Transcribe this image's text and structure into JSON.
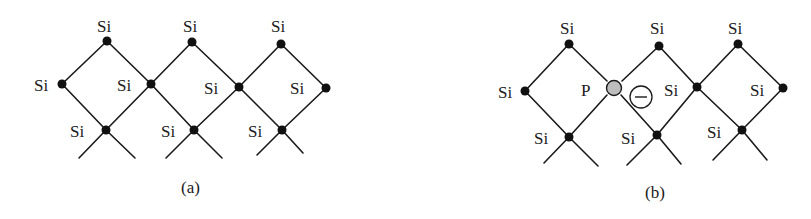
{
  "figure": {
    "panels": [
      {
        "id": "a",
        "caption": "(a)",
        "description": "Pure silicon lattice",
        "atoms": [
          {
            "label": "Si",
            "x": 107,
            "y": 41
          },
          {
            "label": "Si",
            "x": 192,
            "y": 42
          },
          {
            "label": "Si",
            "x": 281,
            "y": 44
          },
          {
            "label": "Si",
            "x": 62,
            "y": 84
          },
          {
            "label": "Si",
            "x": 151,
            "y": 84
          },
          {
            "label": "Si",
            "x": 239,
            "y": 87
          },
          {
            "label": "Si",
            "x": 326,
            "y": 88
          },
          {
            "label": "Si",
            "x": 106,
            "y": 130
          },
          {
            "label": "Si",
            "x": 194,
            "y": 130
          },
          {
            "label": "Si",
            "x": 282,
            "y": 130
          }
        ]
      },
      {
        "id": "b",
        "caption": "(b)",
        "description": "Silicon lattice doped with phosphorus donor and free electron",
        "atoms": [
          {
            "label": "Si",
            "x": 569,
            "y": 44
          },
          {
            "label": "Si",
            "x": 659,
            "y": 46
          },
          {
            "label": "Si",
            "x": 738,
            "y": 44
          },
          {
            "label": "Si",
            "x": 525,
            "y": 91
          },
          {
            "label": "P",
            "x": 614,
            "y": 88,
            "dopant": true
          },
          {
            "label": "Si",
            "x": 697,
            "y": 87
          },
          {
            "label": "Si",
            "x": 783,
            "y": 88
          },
          {
            "label": "Si",
            "x": 569,
            "y": 137
          },
          {
            "label": "Si",
            "x": 657,
            "y": 135
          },
          {
            "label": "Si",
            "x": 742,
            "y": 130
          }
        ],
        "electron": {
          "symbol": "−",
          "x": 641,
          "y": 97
        }
      }
    ],
    "colors": {
      "bond": "#1a1a1a",
      "atom": "#111111",
      "dopant_fill": "#bdbdbd",
      "background": "#ffffff"
    }
  },
  "labels": {
    "a": {
      "si_top_1": "Si",
      "si_top_2": "Si",
      "si_top_3": "Si",
      "si_mid_1": "Si",
      "si_mid_2": "Si",
      "si_mid_3": "Si",
      "si_mid_4": "Si",
      "si_bot_1": "Si",
      "si_bot_2": "Si",
      "si_bot_3": "Si",
      "caption": "(a)"
    },
    "b": {
      "si_top_1": "Si",
      "si_top_2": "Si",
      "si_top_3": "Si",
      "si_mid_1": "Si",
      "p": "P",
      "si_mid_3": "Si",
      "si_mid_4": "Si",
      "si_bot_1": "Si",
      "si_bot_2": "Si",
      "si_bot_3": "Si",
      "electron": "−",
      "caption": "(b)"
    }
  }
}
